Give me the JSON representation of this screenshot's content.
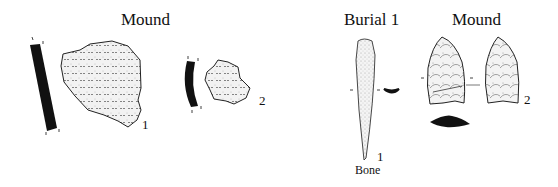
{
  "plate": {
    "groups": [
      {
        "heading": "Mound",
        "artifacts": [
          {
            "number": "1"
          },
          {
            "number": "2"
          }
        ]
      },
      {
        "heading": "Burial 1",
        "artifacts": [
          {
            "number": "1",
            "material": "Bone"
          }
        ]
      },
      {
        "heading": "Mound",
        "artifacts": [
          {
            "number": "2"
          }
        ]
      }
    ]
  },
  "colors": {
    "ink": "#111111",
    "background": "#ffffff",
    "stipple": "#cfcfcf"
  }
}
